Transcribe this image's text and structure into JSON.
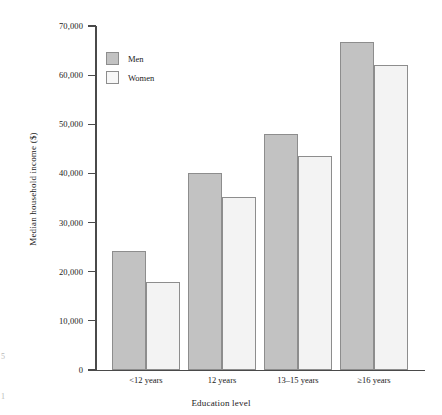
{
  "chart_data": {
    "type": "bar",
    "title": "",
    "xlabel": "Education level",
    "ylabel": "Median household income ($)",
    "categories": [
      "<12 years",
      "12 years",
      "13–15 years",
      "≥16 years"
    ],
    "series": [
      {
        "name": "Men",
        "values": [
          24300,
          40000,
          48000,
          66800
        ]
      },
      {
        "name": "Women",
        "values": [
          18000,
          35300,
          43600,
          62000
        ]
      }
    ],
    "ylim": [
      0,
      70000
    ],
    "yticks": [
      0,
      10000,
      20000,
      30000,
      40000,
      50000,
      60000,
      70000
    ],
    "ytick_labels": [
      "0",
      "10,000",
      "20,000",
      "30,000",
      "40,000",
      "50,000",
      "60,000",
      "70,000"
    ],
    "grid": false,
    "legend_position": "upper left",
    "colors": {
      "men_fill": "#c2c2c2",
      "women_fill": "#f3f3f3",
      "bar_border": "#8d8d8d",
      "axis": "#4a4a4a",
      "text": "#1a1a1a"
    }
  },
  "legend": {
    "items": [
      {
        "label": "Men",
        "swatch": "men"
      },
      {
        "label": "Women",
        "swatch": "women"
      }
    ]
  },
  "margin_artifacts": {
    "top": "5",
    "bottom": "1"
  }
}
